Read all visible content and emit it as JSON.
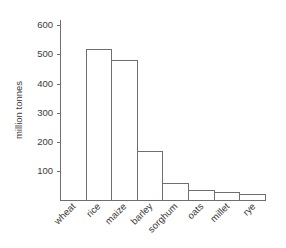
{
  "chart_data": {
    "type": "bar",
    "title": "",
    "subtitle": "",
    "xlabel": "",
    "ylabel": "million tonnes",
    "categories": [
      "wheat",
      "rice",
      "maize",
      "barley",
      "sorghum",
      "oats",
      "millet",
      "rye"
    ],
    "values": [
      560,
      520,
      480,
      170,
      58,
      35,
      29,
      22
    ],
    "ylim": [
      0,
      620
    ],
    "yticks": [
      100,
      200,
      300,
      400,
      500,
      600
    ],
    "ytick_labels": [
      "100",
      "200",
      "300",
      "400",
      "500",
      "600"
    ],
    "grid": false,
    "legend": false,
    "bar_fill_color": "#ffffff",
    "bar_edge_color": "#6e6e6e",
    "axis_color": "#6e6e6e",
    "text_color": "#3a3a3a",
    "background_color": "#ffffff",
    "xtick_label_rotation": 45
  }
}
